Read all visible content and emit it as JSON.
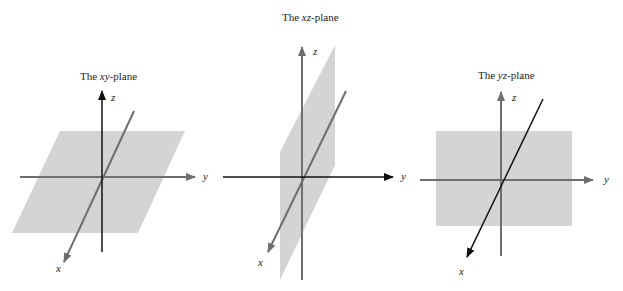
{
  "panels": [
    {
      "title_prefix": "The ",
      "title_var": "xy",
      "title_suffix": "-plane",
      "axis_labels": {
        "x": "x",
        "y": "y",
        "z": "z"
      }
    },
    {
      "title_prefix": "The ",
      "title_var": "xz",
      "title_suffix": "-plane",
      "axis_labels": {
        "x": "x",
        "y": "y",
        "z": "z"
      }
    },
    {
      "title_prefix": "The ",
      "title_var": "yz",
      "title_suffix": "-plane",
      "axis_labels": {
        "x": "x",
        "y": "y",
        "z": "z"
      }
    }
  ],
  "colors": {
    "plane": "#d4d4d4",
    "axis_gray": "#6e6e6e",
    "axis_dark": "#111111",
    "text": "#222222"
  }
}
